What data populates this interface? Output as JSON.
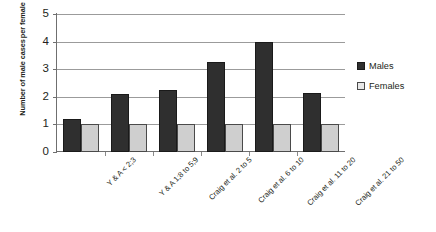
{
  "chart_data": {
    "type": "bar",
    "title": "",
    "xlabel": "",
    "ylabel_lines": [
      "Number of male cases",
      "per female"
    ],
    "ylabel": "Number of male cases per female",
    "ylim": [
      0,
      5
    ],
    "yticks": [
      0,
      1,
      2,
      3,
      4,
      5
    ],
    "grid": true,
    "legend_position": "right",
    "categories": [
      "Y & A < 2;3",
      "Y & A 1;8 to 5;9",
      "Craig et al. 2 to 5",
      "Craig et al. 6 to 10",
      "Craig et al. 11 to 20",
      "Craig et al. 21 to 50"
    ],
    "series": [
      {
        "name": "Males",
        "color": "#2f2f2f",
        "values": [
          1.2,
          2.1,
          2.25,
          3.25,
          4.0,
          2.15
        ]
      },
      {
        "name": "Females",
        "color": "#cfcfcf",
        "values": [
          1.0,
          1.0,
          1.0,
          1.0,
          1.0,
          1.0
        ]
      }
    ]
  }
}
